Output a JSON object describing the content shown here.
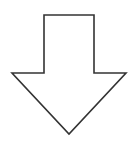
{
  "diagram": {
    "shape": "down-arrow",
    "icon": "arrow-down-icon",
    "colors": {
      "stroke": "#333333",
      "fill": "#ffffff",
      "background": "#ffffff"
    },
    "stroke_width": 1.6,
    "points": "44,15 94,15 94,73 126,73 69,134 12,73 44,73"
  }
}
